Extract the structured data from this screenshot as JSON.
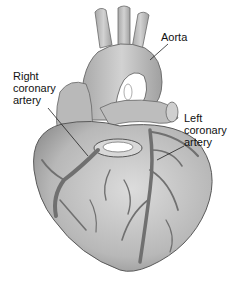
{
  "figure": {
    "labels": [
      {
        "id": "aorta",
        "text": "Aorta"
      },
      {
        "id": "right-coronary-artery",
        "text": "Right\ncoronary\nartery"
      },
      {
        "id": "left-coronary-artery",
        "text": "Left\ncoronary\nartery"
      }
    ]
  },
  "colors": {
    "background": "#ffffff",
    "heart_fill": "#c4c4c4",
    "heart_shade": "#9a9a9a",
    "vessel": "#6e6e6e",
    "outline": "#5a5a5a",
    "label_text": "#111111",
    "leader_line": "#222222"
  }
}
